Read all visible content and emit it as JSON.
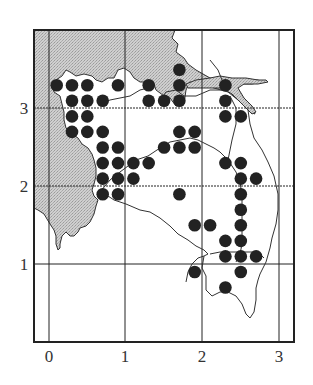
{
  "chart_data": {
    "type": "scatter",
    "title": "",
    "xlabel": "",
    "ylabel": "",
    "xlim": [
      -0.2,
      3.2
    ],
    "ylim": [
      0,
      4
    ],
    "grid": true,
    "x_ticks": [
      "0",
      "1",
      "2",
      "3"
    ],
    "y_ticks": [
      "1",
      "2",
      "3"
    ],
    "legend": null,
    "series": [
      {
        "name": "occurrences",
        "marker": "filled-circle",
        "color": "#222222",
        "points": [
          [
            0.1,
            3.3
          ],
          [
            0.3,
            3.3
          ],
          [
            0.5,
            3.3
          ],
          [
            0.9,
            3.3
          ],
          [
            0.3,
            3.1
          ],
          [
            0.5,
            3.1
          ],
          [
            0.7,
            3.1
          ],
          [
            0.3,
            2.9
          ],
          [
            0.5,
            2.9
          ],
          [
            0.3,
            2.7
          ],
          [
            0.5,
            2.7
          ],
          [
            0.7,
            2.7
          ],
          [
            0.7,
            2.5
          ],
          [
            0.9,
            2.5
          ],
          [
            1.5,
            2.5
          ],
          [
            0.7,
            2.3
          ],
          [
            0.9,
            2.3
          ],
          [
            1.1,
            2.3
          ],
          [
            1.3,
            2.3
          ],
          [
            0.7,
            2.1
          ],
          [
            0.9,
            2.1
          ],
          [
            1.1,
            2.1
          ],
          [
            0.7,
            1.9
          ],
          [
            0.9,
            1.9
          ],
          [
            1.7,
            3.5
          ],
          [
            1.3,
            3.3
          ],
          [
            1.7,
            3.3
          ],
          [
            1.3,
            3.1
          ],
          [
            1.5,
            3.1
          ],
          [
            1.7,
            3.1
          ],
          [
            2.3,
            3.3
          ],
          [
            2.3,
            3.1
          ],
          [
            2.3,
            2.9
          ],
          [
            2.5,
            2.9
          ],
          [
            1.7,
            2.7
          ],
          [
            1.9,
            2.7
          ],
          [
            1.7,
            2.5
          ],
          [
            1.9,
            2.5
          ],
          [
            2.3,
            2.3
          ],
          [
            2.5,
            2.3
          ],
          [
            2.5,
            2.1
          ],
          [
            2.7,
            2.1
          ],
          [
            1.7,
            1.9
          ],
          [
            2.5,
            1.9
          ],
          [
            2.5,
            1.7
          ],
          [
            1.9,
            1.5
          ],
          [
            2.1,
            1.5
          ],
          [
            2.5,
            1.5
          ],
          [
            2.3,
            1.3
          ],
          [
            2.5,
            1.3
          ],
          [
            2.3,
            1.1
          ],
          [
            2.5,
            1.1
          ],
          [
            2.7,
            1.1
          ],
          [
            1.9,
            0.9
          ],
          [
            2.5,
            0.9
          ],
          [
            2.3,
            0.7
          ]
        ]
      }
    ]
  },
  "axes": {
    "x_labels": [
      "0",
      "1",
      "2",
      "3"
    ],
    "y_labels": [
      "1",
      "2",
      "3"
    ]
  },
  "colors": {
    "dot": "#222222",
    "shade": "#c8c8c8",
    "line": "#333333"
  }
}
